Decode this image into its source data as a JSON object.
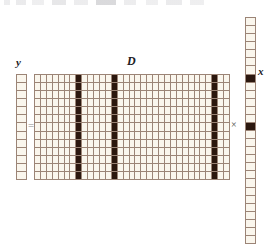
{
  "figure": {
    "type": "sparse-coding-equation",
    "equation": "y = D x",
    "labels": {
      "y": "y",
      "D": "D",
      "x": "x"
    },
    "operators": {
      "equals": "=",
      "times": "×"
    },
    "colors": {
      "cell_light": "#faf6ed",
      "cell_dark": "#2b170e",
      "gridline": "#9b8476",
      "background": "#ffffff",
      "label": "#20201e"
    }
  },
  "chart_data": {
    "type": "heatmap",
    "xlabel": "",
    "ylabel": "",
    "grid": true,
    "legend": "none",
    "blocks": [
      {
        "name": "y",
        "label": "y",
        "role": "signal-vector",
        "rows": 13,
        "cols": 1,
        "nonzero_cells": [],
        "values": [
          0,
          0,
          0,
          0,
          0,
          0,
          0,
          0,
          0,
          0,
          0,
          0,
          0
        ]
      },
      {
        "name": "D",
        "label": "D",
        "role": "dictionary-matrix",
        "rows": 13,
        "cols": 33,
        "highlighted_columns": [
          7,
          13,
          30
        ],
        "note": "three full columns rendered dark, matching nonzero atoms of x"
      },
      {
        "name": "x",
        "label": "x",
        "role": "sparse-coefficient-vector",
        "rows": 28,
        "cols": 1,
        "nonzero_cells": [
          7,
          13,
          30
        ],
        "values": [
          0,
          0,
          0,
          0,
          0,
          0,
          0,
          1,
          0,
          0,
          0,
          0,
          0,
          1,
          0,
          0,
          0,
          0,
          0,
          0,
          0,
          0,
          0,
          0,
          0,
          1,
          0,
          0
        ]
      }
    ]
  }
}
